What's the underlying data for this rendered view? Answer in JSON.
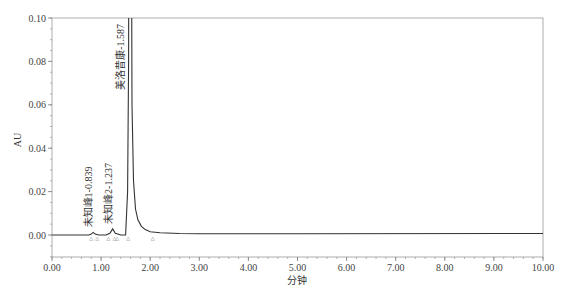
{
  "chart_data": {
    "type": "line",
    "title": "",
    "xlabel": "分钟",
    "ylabel": "AU",
    "xlim": [
      0.0,
      10.0
    ],
    "ylim": [
      -0.013,
      0.1
    ],
    "x_ticks": [
      "0.00",
      "1.00",
      "2.00",
      "3.00",
      "4.00",
      "5.00",
      "6.00",
      "7.00",
      "8.00",
      "9.00",
      "10.00"
    ],
    "y_ticks": [
      "0.00",
      "0.02",
      "0.04",
      "0.06",
      "0.08",
      "0.10"
    ],
    "grid": false,
    "legend": null,
    "series": [
      {
        "name": "chromatogram",
        "color": "#333333",
        "x": [
          0.0,
          0.75,
          0.8,
          0.839,
          0.88,
          0.95,
          1.1,
          1.18,
          1.237,
          1.29,
          1.4,
          1.5,
          1.54,
          1.56,
          1.587,
          1.61,
          1.63,
          1.66,
          1.7,
          1.75,
          1.82,
          1.9,
          2.0,
          2.2,
          2.6,
          3.0,
          5.0,
          10.0
        ],
        "y": [
          0.0,
          0.0,
          0.0004,
          0.0012,
          0.0004,
          0.0,
          0.0,
          0.0008,
          0.0028,
          0.0008,
          0.0,
          0.0,
          0.02,
          0.08,
          0.5,
          0.2,
          0.06,
          0.025,
          0.012,
          0.007,
          0.004,
          0.0025,
          0.0015,
          0.001,
          0.0007,
          0.0006,
          0.0006,
          0.0007
        ]
      }
    ],
    "peaks": [
      {
        "name": "未知峰1",
        "rt": 0.839,
        "label": "未知峰1-0.839"
      },
      {
        "name": "未知峰2",
        "rt": 1.237,
        "label": "未知峰2-1.237"
      },
      {
        "name": "美洛昔康",
        "rt": 1.587,
        "label": "美洛昔康-1.587"
      }
    ],
    "integration_markers": [
      0.8,
      0.92,
      1.15,
      1.27,
      1.33,
      1.55,
      2.05
    ]
  }
}
